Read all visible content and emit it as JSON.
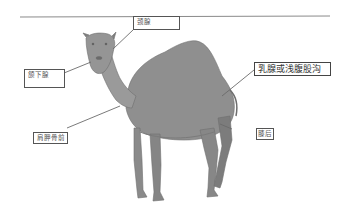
{
  "diagram": {
    "labels": [
      {
        "id": "neck-gland",
        "text": "颈腺"
      },
      {
        "id": "submandibular-gland",
        "text": "颌下腺"
      },
      {
        "id": "mammary-or-superficial-inguinal",
        "text": "乳腺或浅腹股沟"
      },
      {
        "id": "prescapular",
        "text": "肩胛骨前"
      },
      {
        "id": "prefemoral",
        "text": "膝后"
      }
    ],
    "colors": {
      "line": "#6b6b6b",
      "box_border": "#555555",
      "camel_body": "#8a8a8a",
      "background": "#ffffff"
    }
  }
}
